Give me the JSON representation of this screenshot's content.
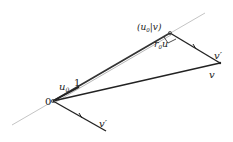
{
  "diagram": {
    "type": "vector projection",
    "labels": {
      "origin": "0",
      "unit": "1",
      "u0": "u",
      "u0_sub": "0",
      "projection": "(u",
      "projection_sub": "0",
      "projection_rest": "|v)",
      "r0u": "r",
      "r0u_sub": "0",
      "r0u_u": "u",
      "v": "v",
      "v_prime_top": "v′",
      "v_prime_bottom": "v′"
    },
    "points": {
      "origin": [
        53,
        101
      ],
      "unit_end": [
        79,
        90
      ],
      "projection": [
        170,
        33
      ],
      "v": [
        220,
        63
      ],
      "v_prime_end": [
        106,
        131
      ],
      "line_start": [
        12,
        125
      ],
      "line_end": [
        205,
        13
      ]
    },
    "colors": {
      "line": "#222222",
      "guide": "#b0b0b0",
      "text": "#222222"
    }
  }
}
